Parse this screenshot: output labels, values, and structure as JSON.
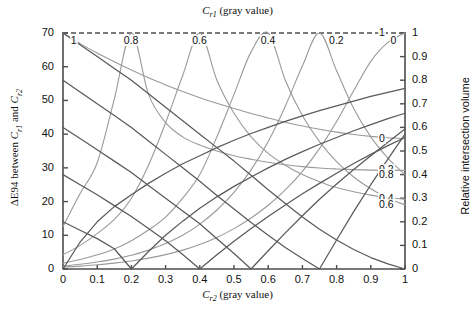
{
  "chart_data": {
    "type": "line",
    "title": "",
    "top_axis_title": "C_r1 (gray value)",
    "xlabel": "C_r2 (gray value)",
    "ylabel_left": "ΔE94 between C_r1 and C_r2",
    "ylabel_right": "Relative intersection volume",
    "xlim": [
      0,
      1
    ],
    "ylim_left": [
      0,
      70
    ],
    "ylim_right": [
      0,
      1
    ],
    "grid": false,
    "legend": "inline-curve-labels",
    "x_ticks": [
      "0",
      "0.1",
      "0.2",
      "0.3",
      "0.4",
      "0.5",
      "0.6",
      "0.7",
      "0.8",
      "0.9",
      "1"
    ],
    "y_ticks_left": [
      "0",
      "10",
      "20",
      "30",
      "40",
      "50",
      "60",
      "70"
    ],
    "y_ticks_right": [
      "0",
      "0.1",
      "0.2",
      "0.3",
      "0.4",
      "0.5",
      "0.6",
      "0.7",
      "0.8",
      "0.9",
      "1"
    ],
    "dashed_reference_line_y": 70,
    "x": [
      0,
      0.05,
      0.1,
      0.15,
      0.2,
      0.25,
      0.3,
      0.35,
      0.4,
      0.45,
      0.5,
      0.55,
      0.6,
      0.65,
      0.7,
      0.75,
      0.8,
      0.85,
      0.9,
      0.95,
      1
    ],
    "series": [
      {
        "name": "dE94 Cr1=1",
        "axis": "left",
        "label": "1",
        "label_at_x": 0.02,
        "values": [
          70.0,
          66.5,
          63.0,
          59.5,
          56.0,
          52.0,
          48.0,
          44.0,
          40.0,
          36.0,
          32.0,
          27.8,
          23.5,
          19.4,
          15.4,
          11.8,
          8.6,
          5.8,
          3.4,
          1.5,
          0.0
        ]
      },
      {
        "name": "dE94 Cr1=0.8",
        "axis": "left",
        "label": "0.8",
        "label_at_x": 0.175,
        "values": [
          56.0,
          52.5,
          49.0,
          45.5,
          42.0,
          38.0,
          34.0,
          30.0,
          26.0,
          21.8,
          17.8,
          13.8,
          10.0,
          6.4,
          3.1,
          0.0,
          8.6,
          17.0,
          25.0,
          32.6,
          40.0
        ]
      },
      {
        "name": "dE94 Cr1=0.6",
        "axis": "left",
        "label": "0.6",
        "label_at_x": 0.375,
        "values": [
          42.0,
          38.7,
          35.4,
          32.0,
          28.6,
          24.8,
          21.0,
          17.2,
          13.4,
          9.0,
          4.6,
          0.0,
          5.4,
          10.7,
          15.8,
          20.7,
          25.2,
          29.5,
          33.6,
          37.6,
          41.5
        ]
      },
      {
        "name": "dE94 Cr1=0.4",
        "axis": "left",
        "label": "0.4",
        "label_at_x": 0.575,
        "values": [
          28.0,
          25.0,
          22.0,
          18.8,
          15.6,
          12.0,
          8.4,
          4.3,
          0.0,
          4.2,
          8.2,
          12.0,
          15.6,
          19.0,
          22.3,
          25.4,
          28.4,
          31.3,
          34.0,
          36.6,
          39.0
        ]
      },
      {
        "name": "dE94 Cr1=0.2",
        "axis": "left",
        "label": "0.2",
        "label_at_x": 0.775,
        "values": [
          14.0,
          11.5,
          9.0,
          6.0,
          0.0,
          5.2,
          10.0,
          14.2,
          18.0,
          21.4,
          24.5,
          27.3,
          30.0,
          32.5,
          34.8,
          37.0,
          39.0,
          41.0,
          42.8,
          44.6,
          46.2
        ]
      },
      {
        "name": "dE94 Cr1=0",
        "axis": "left",
        "label": "0",
        "label_at_x": 0.955,
        "values": [
          0.0,
          8.0,
          14.0,
          18.5,
          22.0,
          25.4,
          28.4,
          31.2,
          33.6,
          36.0,
          38.2,
          40.2,
          42.0,
          43.8,
          45.4,
          47.0,
          48.4,
          49.8,
          51.2,
          52.4,
          53.6
        ]
      },
      {
        "name": "vol Cr1=0",
        "axis": "right",
        "label": "0",
        "label_side": "right",
        "values": [
          1.0,
          0.955,
          0.915,
          0.878,
          0.843,
          0.81,
          0.78,
          0.752,
          0.726,
          0.702,
          0.68,
          0.659,
          0.64,
          0.622,
          0.606,
          0.592,
          0.58,
          0.57,
          0.562,
          0.556,
          0.552
        ]
      },
      {
        "name": "vol Cr1=0.2",
        "axis": "right",
        "label": "0.2",
        "label_side": "right",
        "values": [
          0.18,
          0.32,
          0.45,
          0.72,
          1.0,
          0.74,
          0.62,
          0.56,
          0.525,
          0.5,
          0.48,
          0.465,
          0.452,
          0.442,
          0.434,
          0.428,
          0.424,
          0.421,
          0.419,
          0.418,
          0.418
        ]
      },
      {
        "name": "vol Cr1=0.4",
        "axis": "right",
        "label": "0.4",
        "label_side": "right",
        "values": [
          0.06,
          0.1,
          0.15,
          0.21,
          0.3,
          0.44,
          0.62,
          0.82,
          1.0,
          0.8,
          0.66,
          0.56,
          0.49,
          0.44,
          0.4,
          0.37,
          0.345,
          0.327,
          0.313,
          0.303,
          0.296
        ]
      },
      {
        "name": "vol Cr1=0.6",
        "axis": "right",
        "label": "0.6",
        "label_side": "right",
        "values": [
          0.025,
          0.04,
          0.06,
          0.085,
          0.12,
          0.165,
          0.22,
          0.3,
          0.4,
          0.56,
          0.74,
          0.92,
          1.0,
          0.8,
          0.65,
          0.54,
          0.455,
          0.39,
          0.34,
          0.3,
          0.272
        ]
      },
      {
        "name": "vol Cr1=0.8",
        "axis": "right",
        "label": "0.8",
        "label_side": "right",
        "values": [
          0.012,
          0.02,
          0.03,
          0.042,
          0.058,
          0.08,
          0.108,
          0.143,
          0.19,
          0.25,
          0.325,
          0.42,
          0.54,
          0.69,
          0.86,
          1.0,
          0.84,
          0.68,
          0.56,
          0.47,
          0.4
        ]
      },
      {
        "name": "vol Cr1=1",
        "axis": "right",
        "label": "1",
        "label_side": "right",
        "values": [
          0.008,
          0.012,
          0.018,
          0.025,
          0.034,
          0.046,
          0.061,
          0.08,
          0.104,
          0.134,
          0.171,
          0.216,
          0.27,
          0.335,
          0.414,
          0.51,
          0.625,
          0.755,
          0.88,
          0.96,
          1.0
        ]
      }
    ],
    "colors": {
      "delta_e_curve": "#5a5a5a",
      "volume_curve": "#9a9a9a",
      "axis": "#4d4d4d",
      "dashed_line": "#4d4d4d"
    }
  }
}
